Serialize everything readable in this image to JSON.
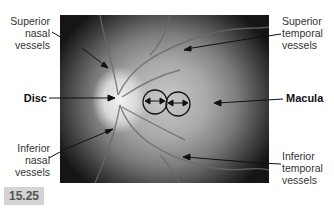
{
  "figure": {
    "number": "15.25",
    "labels": {
      "superior_nasal": [
        "Superior",
        "nasal",
        "vessels"
      ],
      "superior_temporal": [
        "Superior",
        "temporal",
        "vessels"
      ],
      "disc": "Disc",
      "macula": "Macula",
      "inferior_nasal": [
        "Inferior",
        "nasal",
        "vessels"
      ],
      "inferior_temporal": [
        "Inferior",
        "temporal",
        "vessels"
      ]
    },
    "colors": {
      "label_text": "#333333",
      "badge_bg": "#d4d4d4",
      "badge_text": "#555555"
    }
  }
}
